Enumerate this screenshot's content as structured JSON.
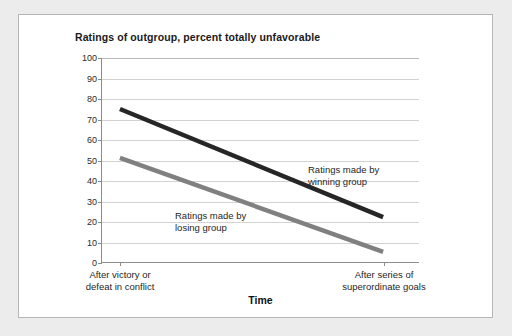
{
  "chart_data": {
    "type": "line",
    "title": "Ratings of outgroup, percent totally unfavorable",
    "xlabel": "Time",
    "ylabel": "",
    "ylim": [
      0,
      100
    ],
    "yticks": [
      0,
      10,
      20,
      30,
      40,
      50,
      60,
      70,
      80,
      90,
      100
    ],
    "grid": true,
    "legend_position": "inline-annotations",
    "categories": [
      "After victory or defeat in conflict",
      "After series of superordinate goals"
    ],
    "x": [
      0,
      1
    ],
    "series": [
      {
        "name": "Ratings made by winning group",
        "values": [
          75,
          22
        ],
        "color": "#262626",
        "annotation": "Ratings made by\nwinning group"
      },
      {
        "name": "Ratings made by losing group",
        "values": [
          51,
          5
        ],
        "color": "#808080",
        "annotation": "Ratings made by\nlosing group"
      }
    ]
  },
  "chart": {
    "title": "Ratings of outgroup, percent totally unfavorable",
    "xaxis_title": "Time",
    "ytick_labels": [
      "100",
      "90",
      "80",
      "70",
      "60",
      "50",
      "40",
      "30",
      "20",
      "10",
      "0"
    ],
    "xtick_labels": [
      {
        "line1": "After victory or",
        "line2": "defeat in conflict"
      },
      {
        "line1": "After series of",
        "line2": "superordinate goals"
      }
    ],
    "annotations": [
      {
        "line1": "Ratings made by",
        "line2": "winning group"
      },
      {
        "line1": "Ratings made by",
        "line2": "losing group"
      }
    ],
    "colors": {
      "winning_group_line": "#262626",
      "losing_group_line": "#808080",
      "axis": "#8c8c8c",
      "gridline": "#d2d2d2",
      "panel_background": "#ffffff",
      "page_background": "#ececec"
    }
  }
}
